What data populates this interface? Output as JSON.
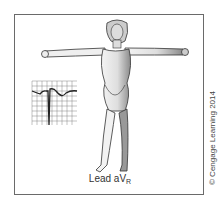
{
  "diagram": {
    "caption_main": "Lead aV",
    "caption_sub": "R",
    "credit": "© Cengage Learning 2014",
    "ecg_strip": {
      "description": "ECG grid showing negative QRS deflection and inverted P and T waves",
      "grid_color": "#555555"
    },
    "figure": "female figure standing with arms outstretched horizontally",
    "colors": {
      "frame": "#6a6a6a",
      "body_fill": "#e8e8e8",
      "outline": "#333333"
    }
  }
}
